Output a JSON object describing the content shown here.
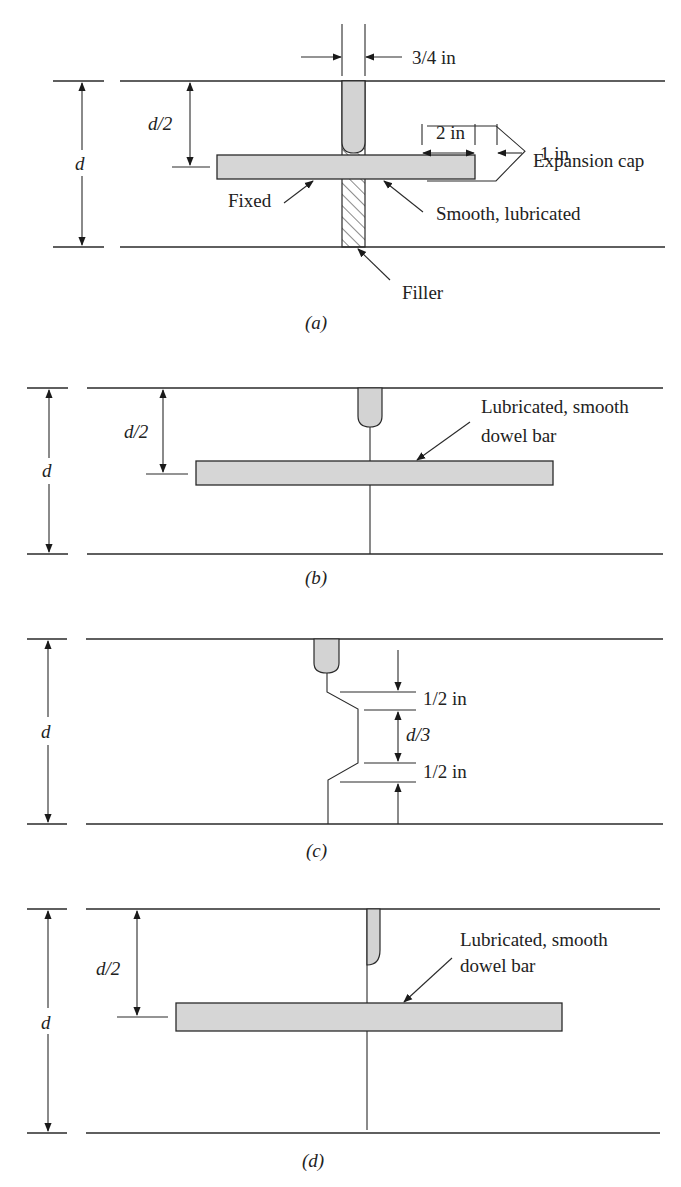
{
  "figure": {
    "panels": [
      {
        "id": "a",
        "caption": "(a)",
        "depth_label": "d",
        "half_depth_label": "d/2",
        "joint_width_label": "3/4 in",
        "cap_length_label": "2 in",
        "cap_gap_label": "1 in",
        "labels": {
          "expansion_cap": "Expansion cap",
          "fixed": "Fixed",
          "smooth": "Smooth, lubricated",
          "filler": "Filler"
        }
      },
      {
        "id": "b",
        "caption": "(b)",
        "depth_label": "d",
        "half_depth_label": "d/2",
        "labels": {
          "dowel_line1": "Lubricated, smooth",
          "dowel_line2": "dowel bar"
        }
      },
      {
        "id": "c",
        "caption": "(c)",
        "depth_label": "d",
        "top_offset_label": "1/2 in",
        "key_label": "d/3",
        "bottom_offset_label": "1/2 in"
      },
      {
        "id": "d",
        "caption": "(d)",
        "depth_label": "d",
        "half_depth_label": "d/2",
        "labels": {
          "dowel_line1": "Lubricated, smooth",
          "dowel_line2": "dowel bar"
        }
      }
    ]
  }
}
